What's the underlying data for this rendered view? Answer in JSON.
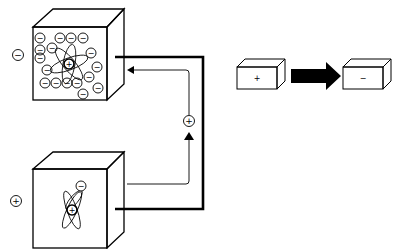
{
  "diagram": {
    "type": "charge-transfer",
    "colors": {
      "line": "#000000",
      "background": "#ffffff"
    },
    "top_cube": {
      "label_outside": "−",
      "electron_symbol": "−",
      "nucleus_symbol": "+",
      "electron_count": 17
    },
    "bottom_cube": {
      "label_outside": "+",
      "electron_symbol": "−",
      "nucleus_symbol": "+"
    },
    "circuit": {
      "carrier_symbol": "+",
      "direction": "bottom-to-top"
    },
    "legend": {
      "from_box_label": "+",
      "to_box_label": "−"
    }
  }
}
